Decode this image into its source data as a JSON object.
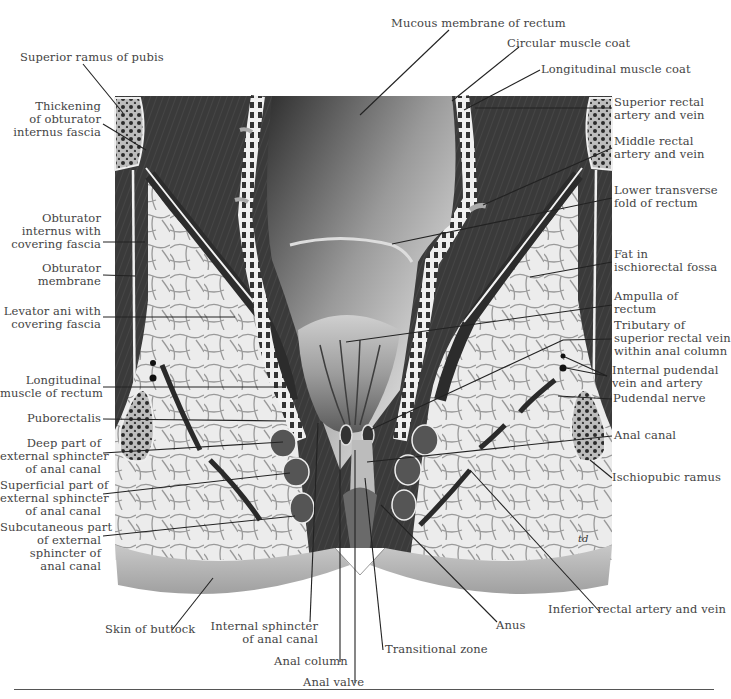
{
  "figure": {
    "signature": "td",
    "colors": {
      "muscle_dark": "#3c3c3c",
      "fat": "#e9e9e9",
      "fat_lines": "#8a8a8a",
      "skin": "#b5b5b5",
      "mucosa_light": "#c8c8c8",
      "bone": "#6a6a6a",
      "leader": "#222222",
      "text": "#444444"
    }
  },
  "labels": {
    "left": [
      {
        "id": "superior-ramus-of-pubis",
        "lines": [
          "Superior ramus of pubis"
        ]
      },
      {
        "id": "thickening-obturator-fascia",
        "lines": [
          "Thickening",
          "of obturator",
          "internus fascia"
        ]
      },
      {
        "id": "obturator-internus",
        "lines": [
          "Obturator",
          "internus with",
          "covering fascia"
        ]
      },
      {
        "id": "obturator-membrane",
        "lines": [
          "Obturator",
          "membrane"
        ]
      },
      {
        "id": "levator-ani",
        "lines": [
          "Levator ani with",
          "covering fascia"
        ]
      },
      {
        "id": "longitudinal-muscle-of-rectum",
        "lines": [
          "Longitudinal",
          "muscle of rectum"
        ]
      },
      {
        "id": "puborectalis",
        "lines": [
          "Puborectalis"
        ]
      },
      {
        "id": "deep-external-sphincter",
        "lines": [
          "Deep part of",
          "external sphincter",
          "of anal canal"
        ]
      },
      {
        "id": "superficial-external-sphincter",
        "lines": [
          "Superficial part of",
          "external sphincter",
          "of anal canal"
        ]
      },
      {
        "id": "subcutaneous-external-sphincter",
        "lines": [
          "Subcutaneous part",
          "of external",
          "sphincter of",
          "anal canal"
        ]
      }
    ],
    "top": [
      {
        "id": "mucous-membrane-of-rectum",
        "lines": [
          "Mucous membrane of rectum"
        ]
      },
      {
        "id": "circular-muscle-coat",
        "lines": [
          "Circular muscle coat"
        ]
      },
      {
        "id": "longitudinal-muscle-coat",
        "lines": [
          "Longitudinal muscle coat"
        ]
      }
    ],
    "right": [
      {
        "id": "superior-rectal-artery-vein",
        "lines": [
          "Superior rectal",
          "artery and vein"
        ]
      },
      {
        "id": "middle-rectal-artery-vein",
        "lines": [
          "Middle rectal",
          "artery and vein"
        ]
      },
      {
        "id": "lower-transverse-fold",
        "lines": [
          "Lower transverse",
          "fold of rectum"
        ]
      },
      {
        "id": "fat-ischiorectal-fossa",
        "lines": [
          "Fat in",
          "ischiorectal fossa"
        ]
      },
      {
        "id": "ampulla-of-rectum",
        "lines": [
          "Ampulla of",
          "rectum"
        ]
      },
      {
        "id": "tributary-superior-rectal-vein",
        "lines": [
          "Tributary of",
          "superior rectal vein",
          "within anal column"
        ]
      },
      {
        "id": "internal-pudendal-vein-artery",
        "lines": [
          "Internal pudendal",
          "vein and artery"
        ]
      },
      {
        "id": "pudendal-nerve",
        "lines": [
          "Pudendal nerve"
        ]
      },
      {
        "id": "anal-canal",
        "lines": [
          "Anal canal"
        ]
      },
      {
        "id": "ischiopubic-ramus",
        "lines": [
          "Ischiopubic ramus"
        ]
      }
    ],
    "bottom": [
      {
        "id": "skin-of-buttock",
        "lines": [
          "Skin of buttock"
        ]
      },
      {
        "id": "internal-sphincter",
        "lines": [
          "Internal sphincter",
          "of anal canal"
        ]
      },
      {
        "id": "anal-column",
        "lines": [
          "Anal column"
        ]
      },
      {
        "id": "anal-valve",
        "lines": [
          "Anal valve"
        ]
      },
      {
        "id": "transitional-zone",
        "lines": [
          "Transitional zone"
        ]
      },
      {
        "id": "anus",
        "lines": [
          "Anus"
        ]
      },
      {
        "id": "inferior-rectal-artery-vein",
        "lines": [
          "Inferior rectal artery and vein"
        ]
      }
    ]
  }
}
